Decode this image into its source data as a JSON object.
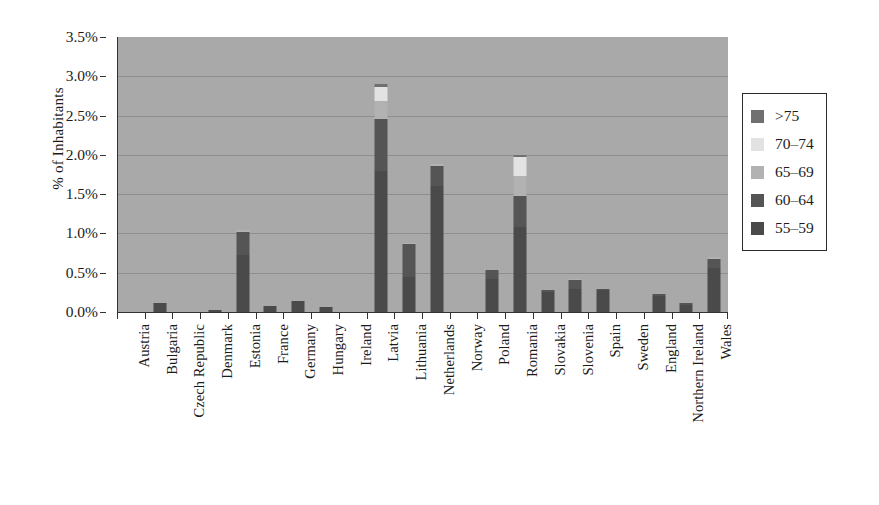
{
  "chart_data": {
    "type": "bar",
    "stacked": true,
    "title": "",
    "subtitle": "",
    "xlabel": "",
    "ylabel": "% of Inhabitants",
    "ylim": [
      0,
      3.5
    ],
    "y_tick_labels": [
      "0.0%",
      "0.5%",
      "1.0%",
      "1.5%",
      "2.0%",
      "2.5%",
      "3.0%",
      "3.5%"
    ],
    "y_tick_values": [
      0,
      0.5,
      1.0,
      1.5,
      2.0,
      2.5,
      3.0,
      3.5
    ],
    "grid": "horizontal",
    "legend_position": "right-outside",
    "plot_background": "#a9a9a9",
    "categories": [
      "Austria",
      "Bulgaria",
      "Czech Republic",
      "Denmark",
      "Estonia",
      "France",
      "Germany",
      "Hungary",
      "Ireland",
      "Latvia",
      "Lithuania",
      "Netherlands",
      "Norway",
      "Poland",
      "Romania",
      "Slovakia",
      "Slovenia",
      "Spain",
      "Sweden",
      "England",
      "Northern Ireland",
      "Wales"
    ],
    "series": [
      {
        "name": "55-59",
        "color": "#4a4a4a",
        "values": [
          0.0,
          0.11,
          0.0,
          0.02,
          0.72,
          0.08,
          0.14,
          0.06,
          0.0,
          1.8,
          0.45,
          1.6,
          0.0,
          0.42,
          1.08,
          0.26,
          0.29,
          0.28,
          0.0,
          0.2,
          0.09,
          0.56
        ]
      },
      {
        "name": "60-64",
        "color": "#555555",
        "values": [
          0.0,
          0.0,
          0.0,
          0.0,
          0.3,
          0.0,
          0.0,
          0.0,
          0.0,
          0.66,
          0.41,
          0.26,
          0.0,
          0.11,
          0.4,
          0.02,
          0.12,
          0.01,
          0.0,
          0.03,
          0.02,
          0.12
        ]
      },
      {
        "name": "65-69",
        "color": "#b2b2b2",
        "values": [
          0.0,
          0.0,
          0.0,
          0.0,
          0.02,
          0.0,
          0.0,
          0.0,
          0.0,
          0.23,
          0.02,
          0.02,
          0.0,
          0.01,
          0.25,
          0.0,
          0.01,
          0.0,
          0.0,
          0.0,
          0.0,
          0.02
        ]
      },
      {
        "name": "70-74",
        "color": "#e2e2e2",
        "values": [
          0.0,
          0.0,
          0.0,
          0.0,
          0.01,
          0.0,
          0.0,
          0.0,
          0.0,
          0.18,
          0.0,
          0.0,
          0.0,
          0.0,
          0.24,
          0.0,
          0.0,
          0.0,
          0.0,
          0.0,
          0.0,
          0.0
        ]
      },
      {
        "name": ">75",
        "color": "#707070",
        "values": [
          0.0,
          0.0,
          0.0,
          0.0,
          0.0,
          0.0,
          0.0,
          0.0,
          0.0,
          0.03,
          0.0,
          0.0,
          0.0,
          0.0,
          0.03,
          0.0,
          0.0,
          0.0,
          0.0,
          0.0,
          0.0,
          0.0
        ]
      }
    ],
    "totals": [
      0.0,
      0.11,
      0.0,
      0.02,
      1.05,
      0.08,
      0.14,
      0.06,
      0.0,
      2.9,
      0.88,
      1.88,
      0.0,
      0.54,
      2.0,
      0.28,
      0.42,
      0.29,
      0.0,
      0.23,
      0.11,
      0.7
    ]
  },
  "legend": {
    "entries": [
      {
        "label": ">75",
        "color": "#707070"
      },
      {
        "label": "70–74",
        "color": "#e2e2e2"
      },
      {
        "label": "65–69",
        "color": "#b2b2b2"
      },
      {
        "label": "60–64",
        "color": "#555555"
      },
      {
        "label": "55–59",
        "color": "#4a4a4a"
      }
    ]
  },
  "axes": {
    "y_title": "% of Inhabitants"
  }
}
